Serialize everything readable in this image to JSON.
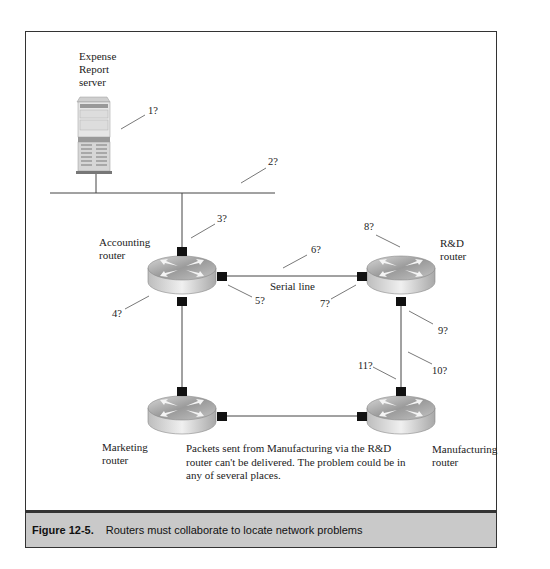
{
  "figure": {
    "number": "Figure 12-5.",
    "caption": "Routers must collaborate to locate network problems",
    "caption_bg": "#c9c9c9"
  },
  "nodes": {
    "server": "Expense\nReport\nserver",
    "accounting": "Accounting\nrouter",
    "rd": "R&D\nrouter",
    "marketing": "Marketing\nrouter",
    "manufacturing": "Manufacturing\nrouter"
  },
  "links": {
    "serial_line": "Serial line"
  },
  "problem_points": [
    "1?",
    "2?",
    "3?",
    "4?",
    "5?",
    "6?",
    "7?",
    "8?",
    "9?",
    "10?",
    "11?"
  ],
  "note": "Packets sent from Manufacturing via the R&D router can't be delivered. The problem could be in any of several places."
}
